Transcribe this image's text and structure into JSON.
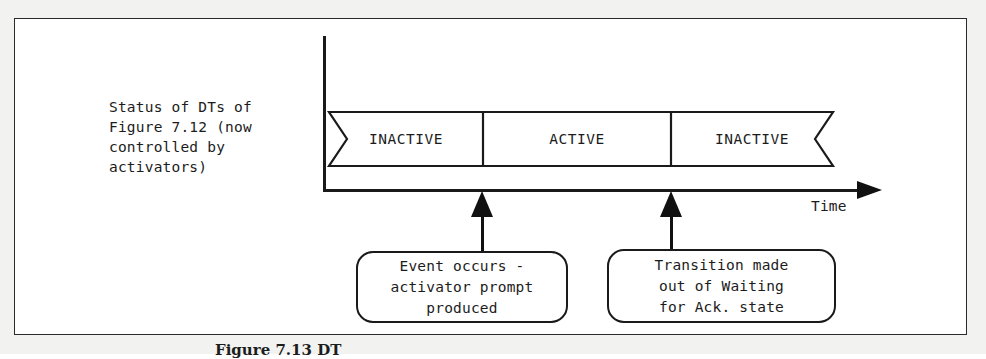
{
  "figure": {
    "side_label": "Status of DTs of\nFigure 7.12 (now\ncontrolled by\nactivators)",
    "caption": "Figure 7.13  DT",
    "frame_color": "#2a2a2a",
    "ink_color": "#1a1a1a"
  },
  "axes": {
    "time_label": "Time",
    "vertical_axis_name": "status-axis",
    "horizontal_axis_name": "time-axis"
  },
  "timeline": {
    "segments": [
      {
        "label": "INACTIVE",
        "left": 0,
        "width": 154
      },
      {
        "label": "ACTIVE",
        "left": 154,
        "width": 188
      },
      {
        "label": "INACTIVE",
        "left": 342,
        "width": 162
      }
    ]
  },
  "events": [
    {
      "name": "event-occurs",
      "pointer_x": 481,
      "callout": "Event occurs -\nactivator prompt\nproduced",
      "box": {
        "left": 355,
        "top": 250,
        "width": 212,
        "height": 72
      }
    },
    {
      "name": "transition-made",
      "pointer_x": 670,
      "callout": "Transition made\nout of Waiting\nfor Ack. state",
      "box": {
        "left": 606,
        "top": 248,
        "width": 229,
        "height": 74
      }
    }
  ]
}
